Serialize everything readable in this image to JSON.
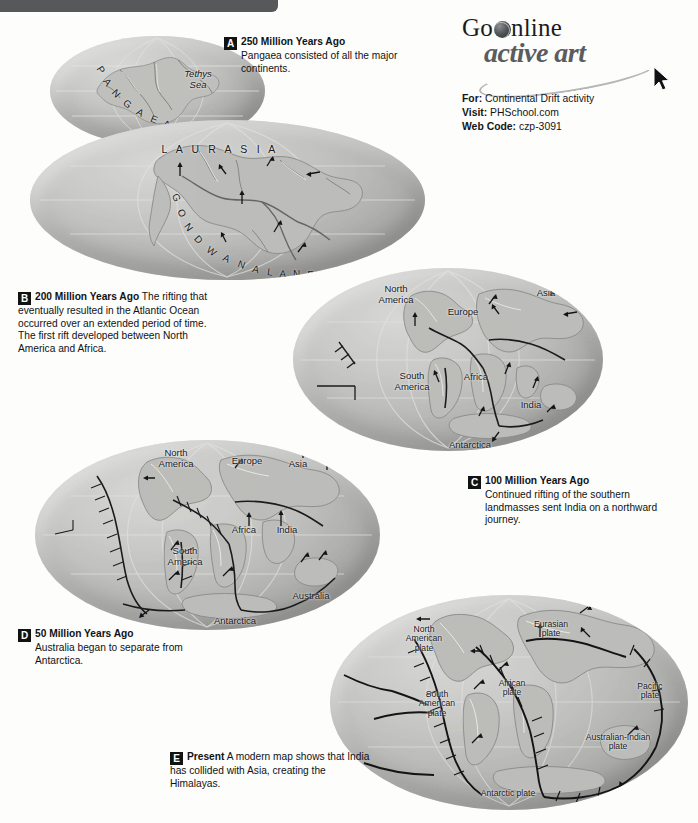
{
  "figure": {
    "title_bar": "",
    "caption_steps": [
      {
        "id": "A",
        "letter": "A",
        "heading": "250 Million Years Ago",
        "text": "Pangaea consisted of all the major continents."
      },
      {
        "id": "B",
        "letter": "B",
        "heading": "200 Million Years Ago",
        "text": "The rifting that eventually resulted in the Atlantic Ocean occurred over an extended period of time. The first rift developed between North America and Africa."
      },
      {
        "id": "C",
        "letter": "C",
        "heading": "100 Million Years Ago",
        "text": "Continued rifting of the southern landmasses sent India on a northward journey."
      },
      {
        "id": "D",
        "letter": "D",
        "heading": "50 Million Years Ago",
        "text": "Australia began to separate from Antarctica."
      },
      {
        "id": "E",
        "letter": "E",
        "heading": "Present",
        "text": "A modern map shows that India has collided with Asia, creating the Himalayas."
      }
    ]
  },
  "logo": {
    "go": "Go",
    "globe_icon": "globe-icon",
    "online": "nline",
    "active_art": "active art",
    "cursor_icon": "cursor-arrow-icon",
    "for_label": "For:",
    "for_value": "Continental Drift activity",
    "visit_label": "Visit:",
    "visit_value": "PHSchool.com",
    "webcode_label": "Web Code:",
    "webcode_value": "czp-3091"
  },
  "globes": {
    "a_inset": {
      "name": "pangaea-inset-globe",
      "labels": [
        {
          "text": "PANGAEA",
          "style": "arched"
        },
        {
          "text": "Tethys\nSea",
          "style": "italic"
        }
      ]
    },
    "b": {
      "name": "globe-200-mya",
      "labels": [
        {
          "text": "L A U R A S I A",
          "style": "spaced"
        },
        {
          "text": "GONDWANALAND",
          "style": "arched"
        }
      ]
    },
    "c": {
      "name": "globe-100-mya",
      "labels": [
        {
          "text": "North\nAmerica"
        },
        {
          "text": "Europe"
        },
        {
          "text": "Asia"
        },
        {
          "text": "South\nAmerica"
        },
        {
          "text": "Africa"
        },
        {
          "text": "India"
        },
        {
          "text": "Australia"
        },
        {
          "text": "Antarctica"
        }
      ]
    },
    "d": {
      "name": "globe-50-mya",
      "labels": [
        {
          "text": "North\nAmerica"
        },
        {
          "text": "Europe"
        },
        {
          "text": "Asia"
        },
        {
          "text": "South\nAmerica"
        },
        {
          "text": "Africa"
        },
        {
          "text": "India"
        },
        {
          "text": "Australia"
        },
        {
          "text": "Antarctica"
        }
      ]
    },
    "e": {
      "name": "globe-present",
      "labels": [
        {
          "text": "North\nAmerican\nplate"
        },
        {
          "text": "Eurasian\nplate"
        },
        {
          "text": "African\nplate"
        },
        {
          "text": "South\nAmerican\nplate"
        },
        {
          "text": "Pacific\nplate"
        },
        {
          "text": "Australian-Indian\nplate"
        },
        {
          "text": "Antarctic plate"
        }
      ]
    }
  },
  "colors": {
    "header_bar": "#56585a",
    "globe_fill": "#c6c6c4",
    "text": "#111214",
    "logo_gray": "#5a5c5e"
  }
}
